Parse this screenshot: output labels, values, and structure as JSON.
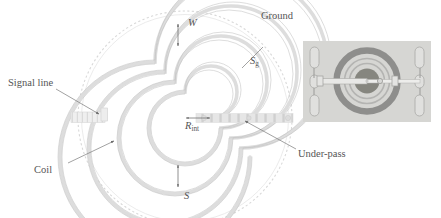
{
  "figure": {
    "type": "technical-diagram",
    "background_color": "#ffffff",
    "ink_color": "#6e6e6e",
    "labels": {
      "signal_line": "Signal line",
      "coil": "Coil",
      "ground": "Ground",
      "under_pass": "Under-pass",
      "width": "W",
      "ground_spacing_base": "S",
      "ground_spacing_sub": "g",
      "inner_radius_base": "R",
      "inner_radius_sub": "int",
      "spacing": "S"
    }
  },
  "diagram": {
    "center": {
      "x": 185,
      "y": 118
    },
    "ground_ring": {
      "radius": 108,
      "stroke": "#d2d2d2",
      "dashed": true
    },
    "spiral": {
      "turns": 7,
      "inner_radius": 26,
      "outer_radius": 95,
      "trace_color": "#d9d9d9",
      "edge_color": "#c3c3c3"
    },
    "under_pass": {
      "orientation": "horizontal",
      "from_x": 196,
      "to_x": 290,
      "y": 118,
      "style": "dashed-hatched",
      "color": "#d8d8d8"
    },
    "signal_pad": {
      "x": 71,
      "y": 112,
      "width": 34,
      "height": 11,
      "color": "#e4e4e4"
    },
    "dimension_markers": [
      {
        "name": "W",
        "x": 178,
        "y_top": 25,
        "y_bottom": 44,
        "kind": "vertical-double-arrow"
      },
      {
        "name": "S",
        "x": 178,
        "y_top": 166,
        "y_bottom": 186,
        "kind": "vertical-double-arrow"
      },
      {
        "name": "R_int",
        "y": 118,
        "x_left": 185,
        "x_right": 211,
        "kind": "horizontal-double-arrow"
      },
      {
        "name": "S_g",
        "kind": "leader-line",
        "x1": 243,
        "y1": 67,
        "x2": 262,
        "y2": 48
      }
    ],
    "leaders": [
      {
        "name": "signal-line-leader",
        "x1": 56,
        "y1": 88,
        "x2": 98,
        "y2": 113
      },
      {
        "name": "coil-leader",
        "x1": 68,
        "y1": 163,
        "x2": 112,
        "y2": 142
      },
      {
        "name": "under-pass-leader",
        "x1": 294,
        "y1": 148,
        "x2": 243,
        "y2": 120
      }
    ]
  },
  "inset": {
    "name": "micrograph",
    "frame": {
      "x": 303,
      "y": 41,
      "width": 128,
      "height": 81
    },
    "background_color": "#d5d5d2",
    "pads": {
      "count_per_side": 3,
      "color": "#dedede",
      "border_color": "#a6a6a6"
    },
    "coil_ring": {
      "outer_color": "#8d8d8d",
      "inner_color": "#b8b8b8"
    },
    "center_disc_color": "#808080",
    "trace_color": "#e6e6e6"
  }
}
